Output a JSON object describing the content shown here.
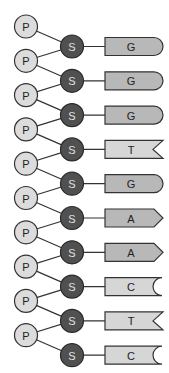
{
  "diagram": {
    "phosphate_label": "P",
    "sugar_label": "S",
    "colors": {
      "phosphate_fill": "#dcdcdc",
      "sugar_fill": "#505050",
      "purine_fill": "#b8b8b8",
      "pyrimidine_fill": "#d6d6d6",
      "stroke": "#333333"
    },
    "base_shapes": {
      "G": "rounded",
      "A": "arrow",
      "T": "notch",
      "C": "concave"
    },
    "nucleotides": [
      {
        "phosphate": "P",
        "sugar": "S",
        "base": "G"
      },
      {
        "phosphate": "P",
        "sugar": "S",
        "base": "G"
      },
      {
        "phosphate": "P",
        "sugar": "S",
        "base": "G"
      },
      {
        "phosphate": "P",
        "sugar": "S",
        "base": "T"
      },
      {
        "phosphate": "P",
        "sugar": "S",
        "base": "G"
      },
      {
        "phosphate": "P",
        "sugar": "S",
        "base": "A"
      },
      {
        "phosphate": "P",
        "sugar": "S",
        "base": "A"
      },
      {
        "phosphate": "P",
        "sugar": "S",
        "base": "C"
      },
      {
        "phosphate": "P",
        "sugar": "S",
        "base": "T"
      },
      {
        "phosphate": "P",
        "sugar": "S",
        "base": "C"
      }
    ]
  }
}
